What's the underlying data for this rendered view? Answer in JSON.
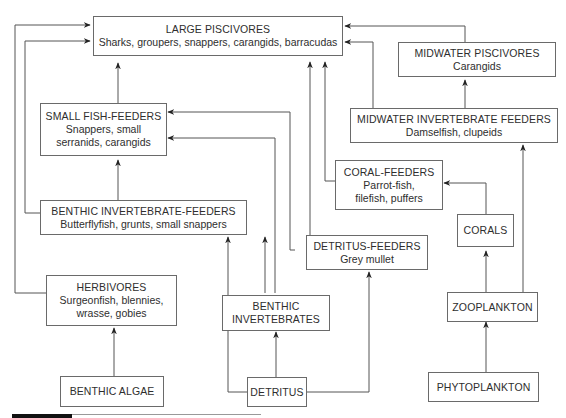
{
  "diagram": {
    "type": "food-web",
    "nodes": {
      "large_piscivores": {
        "title": "LARGE PISCIVORES",
        "subtitle": "Sharks, groupers, snappers, carangids, barracudas"
      },
      "midwater_piscivores": {
        "title": "MIDWATER PISCIVORES",
        "subtitle": "Carangids"
      },
      "midwater_invertebrate_feeders": {
        "title": "MIDWATER INVERTEBRATE FEEDERS",
        "subtitle": "Damselfish, clupeids"
      },
      "small_fish_feeders": {
        "title": "SMALL FISH-FEEDERS",
        "subtitle": "Snappers, small serranids, carangids"
      },
      "coral_feeders": {
        "title": "CORAL-FEEDERS",
        "subtitle": "Parrot-fish, filefish, puffers"
      },
      "benthic_invertebrate_feeders": {
        "title": "BENTHIC INVERTEBRATE-FEEDERS",
        "subtitle": "Butterflyfish, grunts, small snappers"
      },
      "detritus_feeders": {
        "title": "DETRITUS-FEEDERS",
        "subtitle": "Grey mullet"
      },
      "corals": {
        "title": "CORALS"
      },
      "herbivores": {
        "title": "HERBIVORES",
        "subtitle": "Surgeonfish, blennies, wrasse, gobies"
      },
      "benthic_invertebrates": {
        "title": "BENTHIC INVERTEBRATES"
      },
      "zooplankton": {
        "title": "ZOOPLANKTON"
      },
      "benthic_algae": {
        "title": "BENTHIC ALGAE"
      },
      "detritus": {
        "title": "DETRITUS"
      },
      "phytoplankton": {
        "title": "PHYTOPLANKTON"
      }
    },
    "edges": [
      {
        "from": "small_fish_feeders",
        "to": "large_piscivores"
      },
      {
        "from": "benthic_invertebrate_feeders",
        "to": "large_piscivores"
      },
      {
        "from": "herbivores",
        "to": "large_piscivores"
      },
      {
        "from": "midwater_piscivores",
        "to": "large_piscivores"
      },
      {
        "from": "midwater_invertebrate_feeders",
        "to": "large_piscivores"
      },
      {
        "from": "coral_feeders",
        "to": "large_piscivores"
      },
      {
        "from": "detritus_feeders",
        "to": "large_piscivores"
      },
      {
        "from": "midwater_invertebrate_feeders",
        "to": "midwater_piscivores"
      },
      {
        "from": "benthic_invertebrate_feeders",
        "to": "small_fish_feeders"
      },
      {
        "from": "detritus_feeders",
        "to": "small_fish_feeders"
      },
      {
        "from": "benthic_invertebrates",
        "to": "small_fish_feeders"
      },
      {
        "from": "corals",
        "to": "coral_feeders"
      },
      {
        "from": "zooplankton",
        "to": "corals"
      },
      {
        "from": "zooplankton",
        "to": "midwater_invertebrate_feeders"
      },
      {
        "from": "phytoplankton",
        "to": "zooplankton"
      },
      {
        "from": "benthic_invertebrates",
        "to": "benthic_invertebrate_feeders"
      },
      {
        "from": "detritus",
        "to": "benthic_invertebrate_feeders"
      },
      {
        "from": "detritus",
        "to": "benthic_invertebrates"
      },
      {
        "from": "detritus",
        "to": "detritus_feeders"
      },
      {
        "from": "benthic_algae",
        "to": "herbivores"
      }
    ],
    "colors": {
      "line": "#555555",
      "box_border": "#6a6a6a",
      "text": "#2e2e2e"
    }
  }
}
